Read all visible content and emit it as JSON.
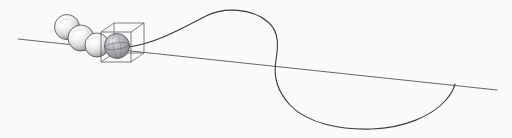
{
  "figure": {
    "caption": "",
    "background_color": "#fafafa",
    "width": 512,
    "height": 138,
    "line_color": "#4a4a52",
    "curve_color": "#3a3a42",
    "sphere_outline_color": "#4a4a4a",
    "sphere_light_color": "#ffffff",
    "sphere_mid_color": "#d9d9d9",
    "sphere_shadow_color": "#8e8e8e",
    "cube_edge_color": "#585860",
    "highlight_sphere_color": "#9a9aa0"
  },
  "axis_line": {
    "label": "straight-trajectory-line",
    "start": {
      "x": 18,
      "y": 39
    },
    "end": {
      "x": 497,
      "y": 90
    },
    "stroke_width": 0.9,
    "color": "#55555d"
  },
  "curve": {
    "label": "looping-trajectory-curve",
    "stroke_width": 1.1,
    "color": "#3a3a42",
    "start": {
      "x": 128,
      "y": 47
    },
    "peak": {
      "x": 230,
      "y": 11
    },
    "crossing": {
      "x": 282,
      "y": 68
    },
    "bottom": {
      "x": 385,
      "y": 128
    },
    "end": {
      "x": 455,
      "y": 84
    },
    "path": "M128,47 C158,43 186,26 206,16 C224,7 252,8 268,22 C280,32 278,48 276,60 C273,76 278,92 290,105 C308,124 342,130 372,129 C404,128 432,116 446,100 C452,93 454,88 455,84"
  },
  "spheres": [
    {
      "name": "sphere-1",
      "cx": 67,
      "cy": 27,
      "r": 12.5,
      "shade": "light"
    },
    {
      "name": "sphere-2",
      "cx": 81,
      "cy": 38,
      "r": 13.0,
      "shade": "light"
    },
    {
      "name": "sphere-3",
      "cx": 97,
      "cy": 45,
      "r": 12.0,
      "shade": "light"
    },
    {
      "name": "sphere-4",
      "cx": 117,
      "cy": 46,
      "r": 12.5,
      "shade": "dark"
    }
  ],
  "cube": {
    "label": "wireframe-bounding-cube",
    "center": {
      "x": 117,
      "y": 46
    },
    "front_x": 101,
    "front_y": 32,
    "front_size": 30,
    "depth_dx": 13,
    "depth_dy": -9,
    "edge_color": "#585860",
    "stroke_width": 0.8
  },
  "accessibility": {
    "description": "Technical illustration: a chain of four spheres descending along a straight line toward the lower right; the rightmost shaded sphere is enclosed in a wireframe cube, from which a looping curve rises to a peak, descends through the straight line, and loops beneath it before rejoining the line."
  }
}
